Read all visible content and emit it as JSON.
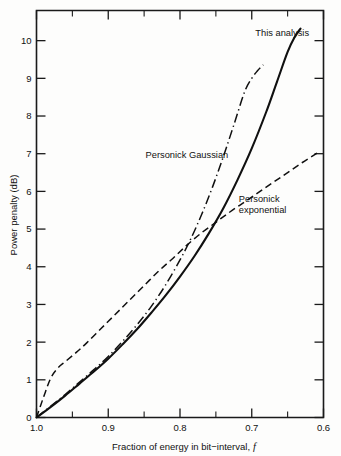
{
  "chart_data": {
    "type": "line",
    "title": "",
    "xlabel": "Fraction of energy in bit−interval,",
    "xlabel_symbol": "f",
    "ylabel": "Power penalty (dB)",
    "xlim": [
      1.0,
      0.6
    ],
    "ylim": [
      0,
      10.8
    ],
    "x_reversed": true,
    "grid": false,
    "legend_position": "inline-annotations",
    "xticks": [
      "1.0",
      "0.9",
      "0.8",
      "0.7",
      "0.6"
    ],
    "xtick_values": [
      1.0,
      0.9,
      0.8,
      0.7,
      0.6
    ],
    "xminor_values": [
      0.95,
      0.85,
      0.75,
      0.65
    ],
    "yticks": [
      "0",
      "1",
      "2",
      "3",
      "4",
      "5",
      "6",
      "7",
      "8",
      "9",
      "10"
    ],
    "ytick_values": [
      0,
      1,
      2,
      3,
      4,
      5,
      6,
      7,
      8,
      9,
      10
    ],
    "series": [
      {
        "name": "This analysis",
        "style": "solid",
        "label_x": 0.695,
        "label_y": 10.12,
        "x": [
          1.0,
          0.98,
          0.96,
          0.94,
          0.92,
          0.9,
          0.88,
          0.86,
          0.84,
          0.82,
          0.8,
          0.78,
          0.76,
          0.74,
          0.72,
          0.7,
          0.68,
          0.665,
          0.65,
          0.64,
          0.632
        ],
        "y": [
          0.0,
          0.28,
          0.58,
          0.9,
          1.22,
          1.56,
          1.94,
          2.34,
          2.78,
          3.24,
          3.74,
          4.28,
          4.88,
          5.54,
          6.3,
          7.14,
          8.1,
          8.9,
          9.7,
          10.1,
          10.32
        ]
      },
      {
        "name": "Personick Gaussian",
        "style": "dashdot",
        "label_x": 0.848,
        "label_y": 6.88,
        "x": [
          1.0,
          0.98,
          0.96,
          0.94,
          0.92,
          0.9,
          0.88,
          0.86,
          0.84,
          0.82,
          0.8,
          0.785,
          0.77,
          0.755,
          0.74,
          0.725,
          0.71,
          0.7,
          0.692,
          0.684
        ],
        "y": [
          0.0,
          0.3,
          0.61,
          0.94,
          1.27,
          1.62,
          2.02,
          2.46,
          2.95,
          3.52,
          4.18,
          4.74,
          5.38,
          6.1,
          6.9,
          7.76,
          8.64,
          9.0,
          9.2,
          9.36
        ]
      },
      {
        "name": "Personick exponential",
        "style": "dashed",
        "label_line1": "Personick",
        "label_line2": "exponential",
        "label_x": 0.718,
        "label_y": 5.72,
        "x": [
          1.0,
          0.99,
          0.98,
          0.97,
          0.96,
          0.945,
          0.93,
          0.91,
          0.89,
          0.87,
          0.85,
          0.83,
          0.81,
          0.79,
          0.77,
          0.75,
          0.73,
          0.71,
          0.69,
          0.67,
          0.65,
          0.63,
          0.61,
          0.604
        ],
        "y": [
          0.0,
          0.55,
          1.05,
          1.32,
          1.48,
          1.72,
          1.98,
          2.36,
          2.74,
          3.12,
          3.5,
          3.88,
          4.22,
          4.58,
          4.9,
          5.18,
          5.46,
          5.72,
          5.98,
          6.24,
          6.5,
          6.76,
          7.0,
          7.06
        ]
      }
    ]
  },
  "axis_titles": {
    "x": "Fraction of energy in bit−interval,",
    "x_symbol": "f",
    "y": "Power penalty (dB)"
  }
}
